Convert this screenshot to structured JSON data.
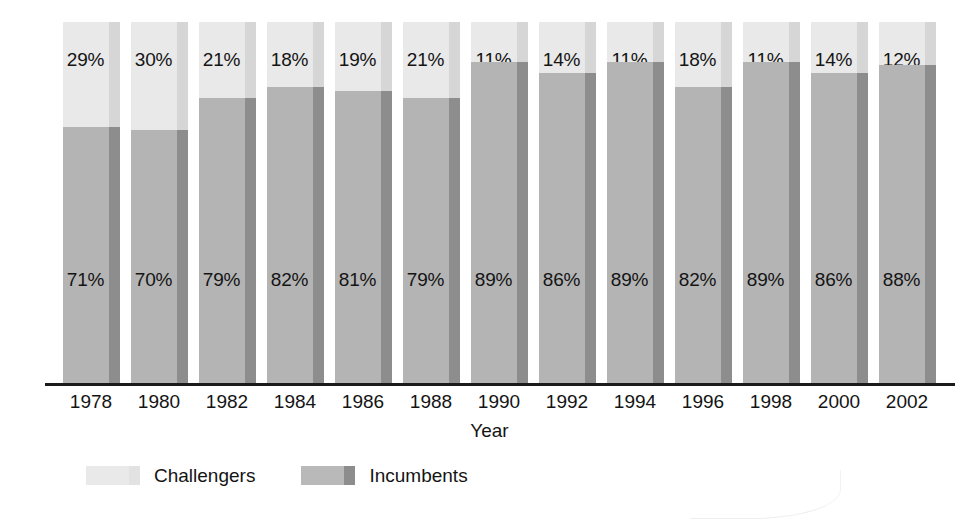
{
  "chart_data": {
    "type": "bar",
    "subtype": "100% stacked column",
    "title": "",
    "xlabel": "Year",
    "ylabel": "",
    "ylim": [
      0,
      100
    ],
    "grid": false,
    "legend_position": "bottom-left",
    "categories": [
      "1978",
      "1980",
      "1982",
      "1984",
      "1986",
      "1988",
      "1990",
      "1992",
      "1994",
      "1996",
      "1998",
      "2000",
      "2002"
    ],
    "series": [
      {
        "name": "Challengers",
        "color": "#e9e9e9",
        "edge_color": "#d6d6d6",
        "values": [
          29,
          30,
          21,
          18,
          19,
          21,
          11,
          14,
          11,
          18,
          11,
          14,
          12
        ],
        "labels": [
          "29%",
          "30%",
          "21%",
          "18%",
          "19%",
          "21%",
          "11%",
          "14%",
          "11%",
          "18%",
          "11%",
          "14%",
          "12%"
        ]
      },
      {
        "name": "Incumbents",
        "color": "#b4b4b4",
        "edge_color": "#8d8d8d",
        "values": [
          71,
          70,
          79,
          82,
          81,
          79,
          89,
          86,
          89,
          82,
          89,
          86,
          88
        ],
        "labels": [
          "71%",
          "70%",
          "79%",
          "82%",
          "81%",
          "79%",
          "89%",
          "86%",
          "89%",
          "82%",
          "89%",
          "86%",
          "88%"
        ]
      }
    ]
  },
  "axis": {
    "x_title": "Year"
  },
  "legend": {
    "items": [
      {
        "label": "Challengers",
        "swatch": "challenger-swatch"
      },
      {
        "label": "Incumbents",
        "swatch": "incumbent-swatch"
      }
    ]
  }
}
